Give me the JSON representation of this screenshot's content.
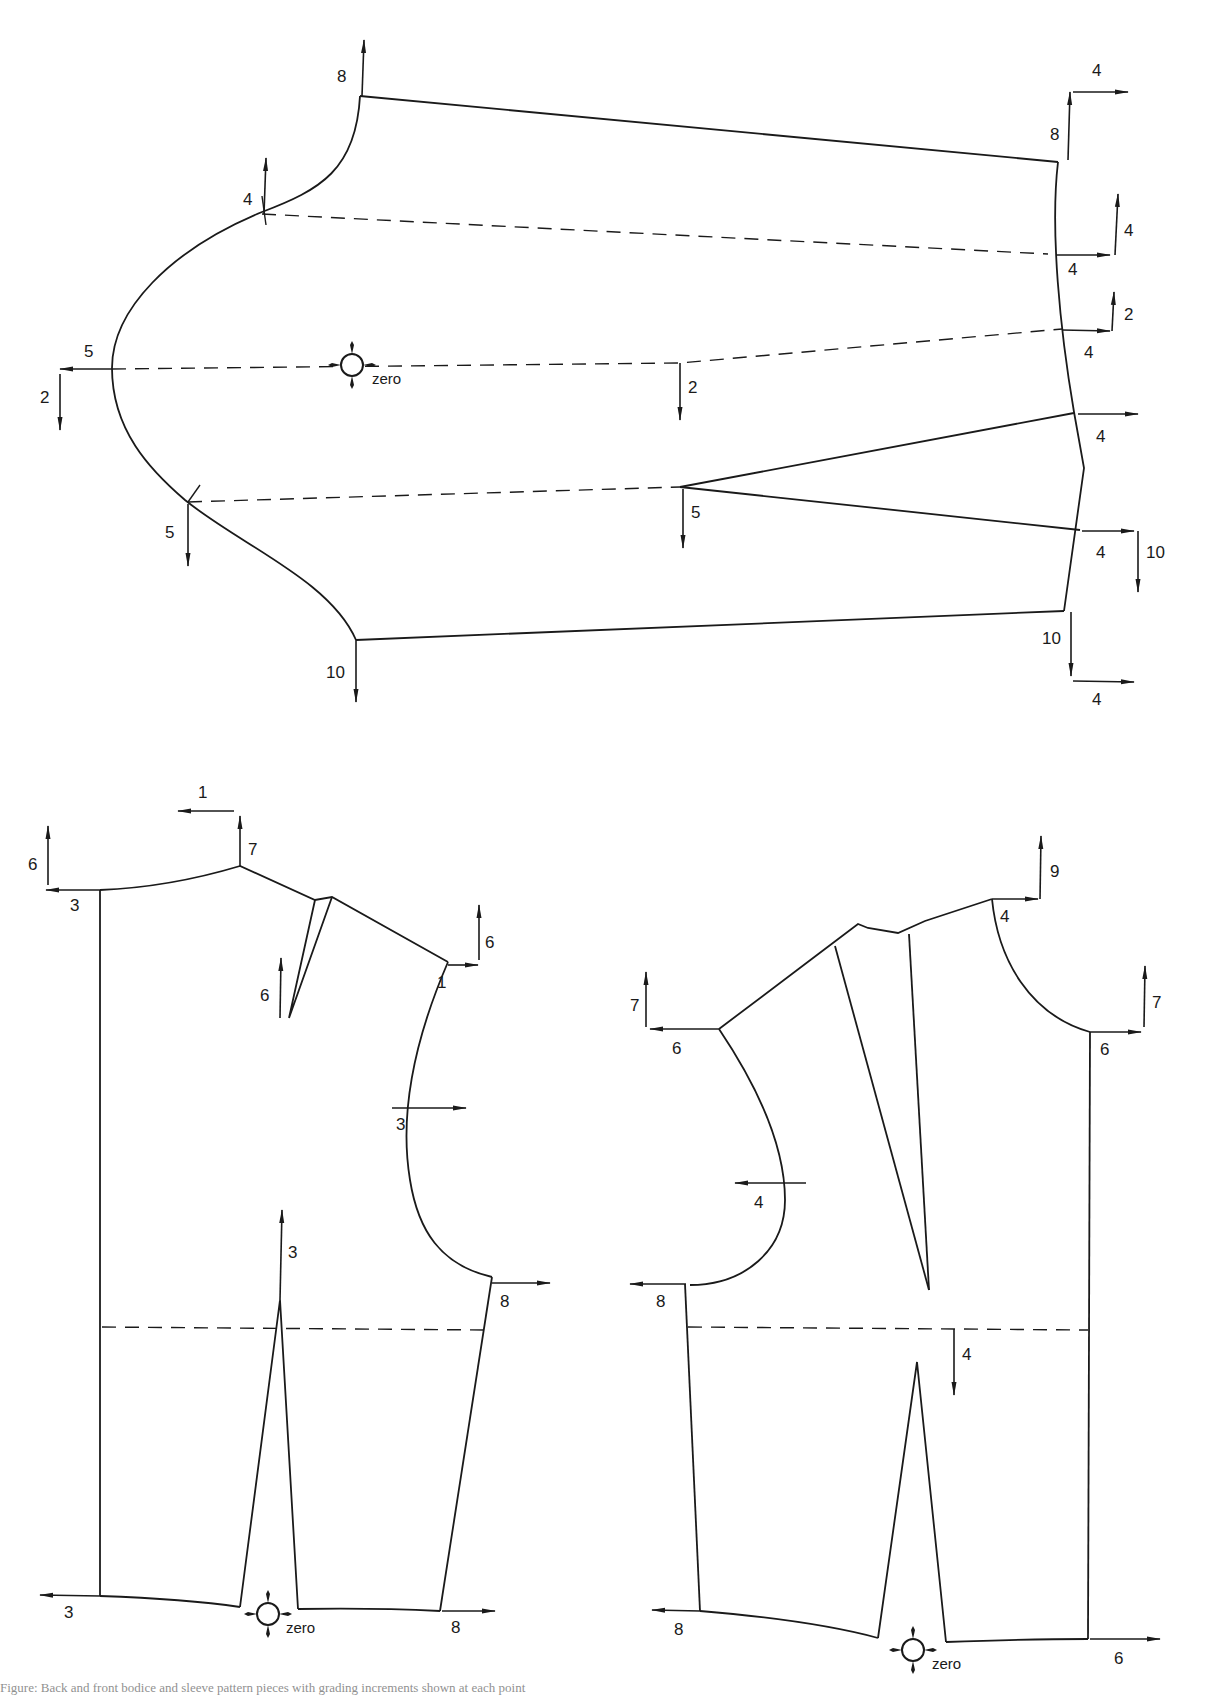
{
  "diagram": {
    "type": "pattern-grading-nest",
    "pieces": [
      {
        "name": "sleeve",
        "zero_point_label": "zero",
        "grade_labels": {
          "sleeve_cap_top_up": "8",
          "front_notch_up": "4",
          "underarm_left": "5",
          "underarm_left_down": "2",
          "back_notch_down": "5",
          "underarm_bottom_down": "10",
          "center_dashed_down": "2",
          "elbow_dart_down": "5",
          "wrist_top_up": "8",
          "wrist_top_right": "4",
          "wrist_upper_right": "4",
          "wrist_upper_up": "4",
          "wrist_mid_right": "4",
          "wrist_mid_up": "2",
          "dart_upper_right": "4",
          "dart_lower_right": "4",
          "dart_lower_down": "10",
          "hem_bottom_down": "10",
          "hem_bottom_right": "4"
        }
      },
      {
        "name": "back-bodice",
        "zero_point_label": "zero",
        "grade_labels": {
          "neck_center_up": "6",
          "neck_center_left": "3",
          "neck_side_left": "1",
          "neck_side_up": "7",
          "shoulder_dart_up": "6",
          "shoulder_tip_up": "6",
          "shoulder_tip_right": "1",
          "armhole_mid_right": "3",
          "waist_dart_up": "3",
          "underarm_right": "8",
          "hem_left": "3",
          "hem_right": "8"
        }
      },
      {
        "name": "front-bodice",
        "zero_point_label": "zero",
        "grade_labels": {
          "neck_side_up": "9",
          "neck_side_right": "4",
          "center_front_up": "7",
          "center_front_right": "6",
          "shoulder_tip_up": "7",
          "shoulder_tip_left": "6",
          "armhole_mid_left": "4",
          "underarm_left": "8",
          "bust_line_down": "4",
          "hem_left": "8",
          "hem_right": "6"
        }
      }
    ],
    "caption": "Figure: Back and front bodice and sleeve pattern pieces with grading increments shown at each point"
  }
}
